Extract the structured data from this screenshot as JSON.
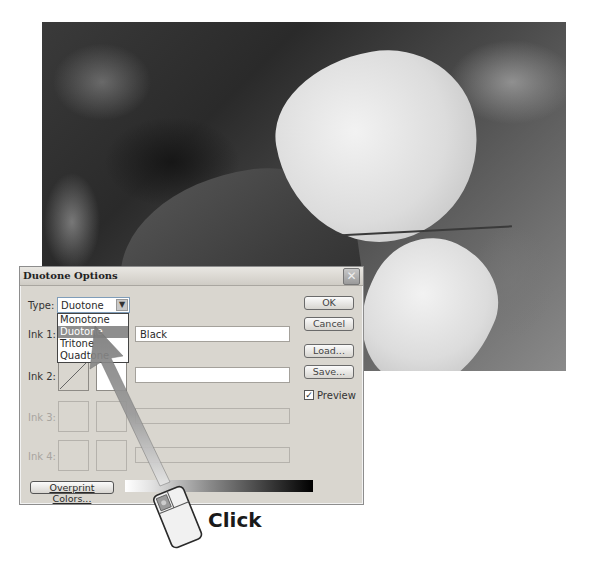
{
  "photo": {
    "description": "grayscale photo of leaves"
  },
  "dialog": {
    "title": "Duotone Options",
    "close_icon": "close-x-icon",
    "type": {
      "label": "Type:",
      "selected": "Duotone",
      "options": [
        "Monotone",
        "Duotone",
        "Tritone",
        "Quadtone"
      ],
      "highlighted_index": 1
    },
    "inks": [
      {
        "label": "Ink 1:",
        "name": "Black",
        "enabled": true
      },
      {
        "label": "Ink 2:",
        "name": "",
        "enabled": true
      },
      {
        "label": "Ink 3:",
        "name": "",
        "enabled": false
      },
      {
        "label": "Ink 4:",
        "name": "",
        "enabled": false
      }
    ],
    "buttons": {
      "ok": "OK",
      "cancel": "Cancel",
      "load": "Load...",
      "save": "Save..."
    },
    "preview": {
      "label": "Preview",
      "checked": true,
      "check_glyph": "✓"
    },
    "overprint_button": "Overprint Colors..."
  },
  "annotation": {
    "callout": "Click",
    "accent_color": "#8a8a8a"
  }
}
